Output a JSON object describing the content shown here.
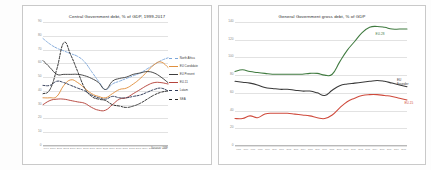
{
  "colors": {
    "north_africa": "#7da7d9",
    "eu_candidate": "#e0903f",
    "eu_present": "#3f3f3f",
    "eu_11": "#b5443c",
    "latam": "#2f3a56",
    "sea": "#262626",
    "eu_28": "#3f7a3f",
    "eu_founder": "#3a3a3a",
    "eu_15": "#cf4a3c",
    "grid": "#e2e2e2",
    "axis": "#b9b9b9",
    "panel_border": "#c9c9c9",
    "title_text": "#2b2b2b",
    "tick_text": "#8a8a8a"
  },
  "left_panel": {
    "source_note": "Source: IMF",
    "legend": [
      {
        "label": "North Africa",
        "color": "#7da7d9",
        "dash": "2,1.4"
      },
      {
        "label": "EU Candidate",
        "color": "#e0903f",
        "dash": ""
      },
      {
        "label": "EU Present",
        "color": "#3f3f3f",
        "dash": ""
      },
      {
        "label": "EU-11",
        "color": "#b5443c",
        "dash": ""
      },
      {
        "label": "Latam",
        "color": "#2f3a56",
        "dash": "2,1.4"
      },
      {
        "label": "SEA",
        "color": "#262626",
        "dash": "2,1.4"
      }
    ]
  },
  "right_panel": {
    "inline_labels": [
      {
        "text": "EU-28",
        "color": "#3f7a3f"
      },
      {
        "text": "EU\nFounder",
        "color": "#3a3a3a"
      },
      {
        "text": "EU-15",
        "color": "#cf4a3c"
      }
    ]
  },
  "chart_data": [
    {
      "id": "central-government-debt",
      "type": "line",
      "title": "Central Government debt, % of GDP, 1999-2017",
      "xlabel": "",
      "ylabel": "",
      "ylim": [
        0,
        90
      ],
      "yticks": [
        0,
        10,
        20,
        30,
        40,
        50,
        60,
        70,
        80,
        90
      ],
      "grid": true,
      "legend_position": "right",
      "annotations": [
        "Source: IMF"
      ],
      "x": [
        1999,
        2000,
        2001,
        2002,
        2003,
        2004,
        2005,
        2006,
        2007,
        2008,
        2009,
        2010,
        2011,
        2012,
        2013,
        2014,
        2015,
        2016,
        2017
      ],
      "series": [
        {
          "name": "North Africa",
          "color": "#7da7d9",
          "style": "dashed",
          "values": [
            78,
            74,
            71,
            69,
            67,
            65,
            61,
            54,
            47,
            41,
            45,
            47,
            49,
            51,
            53,
            56,
            59,
            62,
            64
          ]
        },
        {
          "name": "EU Candidate",
          "color": "#e0903f",
          "style": "solid",
          "values": [
            35,
            35,
            36,
            44,
            48,
            46,
            42,
            38,
            36,
            35,
            38,
            41,
            42,
            45,
            49,
            54,
            59,
            61,
            57
          ]
        },
        {
          "name": "EU Present",
          "color": "#3f3f3f",
          "style": "solid",
          "values": [
            62,
            57,
            52,
            52,
            52,
            52,
            51,
            49,
            46,
            41,
            47,
            49,
            50,
            52,
            53,
            54,
            53,
            50,
            46
          ]
        },
        {
          "name": "EU-11",
          "color": "#b5443c",
          "style": "solid",
          "values": [
            30,
            33,
            34,
            34,
            33,
            32,
            31,
            28,
            26,
            26,
            30,
            34,
            35,
            38,
            41,
            44,
            46,
            46,
            45
          ]
        },
        {
          "name": "Latam",
          "color": "#2f3a56",
          "style": "dashed",
          "values": [
            44,
            44,
            47,
            46,
            44,
            42,
            40,
            37,
            35,
            34,
            36,
            35,
            35,
            36,
            37,
            39,
            41,
            42,
            40
          ]
        },
        {
          "name": "SEA",
          "color": "#262626",
          "style": "dashed",
          "values": [
            38,
            41,
            56,
            75,
            66,
            54,
            42,
            36,
            34,
            33,
            30,
            29,
            28,
            29,
            31,
            34,
            37,
            39,
            40
          ]
        }
      ]
    },
    {
      "id": "general-government-gross-debt",
      "type": "line",
      "title": "General Government gross debt, % of GDP",
      "xlabel": "",
      "ylabel": "",
      "ylim": [
        0,
        140
      ],
      "yticks": [
        0,
        20,
        40,
        60,
        80,
        100,
        120,
        140
      ],
      "grid": true,
      "legend_position": "inline",
      "x": [
        1995,
        1996,
        1997,
        1998,
        1999,
        2000,
        2001,
        2002,
        2003,
        2004,
        2005,
        2006,
        2007,
        2008,
        2009,
        2010,
        2011,
        2012,
        2013,
        2014,
        2015,
        2016,
        2017,
        2018
      ],
      "series": [
        {
          "name": "EU-28",
          "color": "#3f7a3f",
          "style": "solid",
          "values": [
            84,
            86,
            84,
            83,
            82,
            81,
            81,
            81,
            81,
            81,
            82,
            82,
            80,
            81,
            95,
            108,
            118,
            128,
            134,
            135,
            134,
            132,
            132,
            132
          ]
        },
        {
          "name": "EU Founder",
          "color": "#3a3a3a",
          "style": "solid",
          "values": [
            73,
            72,
            71,
            69,
            66,
            65,
            64,
            64,
            63,
            62,
            62,
            60,
            57,
            63,
            68,
            70,
            71,
            72,
            73,
            74,
            73,
            71,
            69,
            67
          ]
        },
        {
          "name": "EU-15",
          "color": "#cf4a3c",
          "style": "solid",
          "values": [
            31,
            31,
            34,
            32,
            36,
            37,
            37,
            37,
            36,
            35,
            34,
            32,
            31,
            35,
            43,
            50,
            54,
            57,
            58,
            58,
            57,
            56,
            54,
            52
          ]
        }
      ]
    }
  ]
}
